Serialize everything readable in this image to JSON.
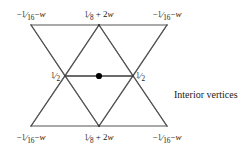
{
  "figure": {
    "type": "triangular-mesh-stencil",
    "caption": "Interior vertices",
    "corner_label": {
      "sign": "−",
      "numerator": "1",
      "slash": "⁄",
      "denominator": "16",
      "tail": "− w",
      "plain": "−1⁄16 − w"
    },
    "edge_mid_label": {
      "numerator": "1",
      "slash": "⁄",
      "denominator": "8",
      "tail": "+ 2w",
      "plain": "1⁄8 + 2w"
    },
    "center_side_label": {
      "numerator": "1",
      "slash": "⁄",
      "denominator": "2",
      "plain": "1⁄2"
    },
    "labels": {
      "top_left": "−1⁄16 − w",
      "top_center": "1⁄8 + 2w",
      "top_right": "−1⁄16 − w",
      "middle_left": "1⁄2",
      "middle_right": "1⁄2",
      "bottom_left": "−1⁄16 − w",
      "bottom_center": "1⁄8 + 2w",
      "bottom_right": "−1⁄16 − w"
    },
    "colors": {
      "line": "#555555",
      "heavy_line": "#3a3a3a",
      "dot": "#000000",
      "text": "#1a1a1a",
      "background": "#ffffff"
    },
    "geometry": {
      "left_x": 31,
      "center_x": 99,
      "right_x": 167,
      "mid_left_x": 65,
      "mid_right_x": 133,
      "top_y": 25,
      "mid_y": 76,
      "bottom_y": 126,
      "center_dot": {
        "x": 99,
        "y": 76,
        "r": 3
      }
    }
  }
}
